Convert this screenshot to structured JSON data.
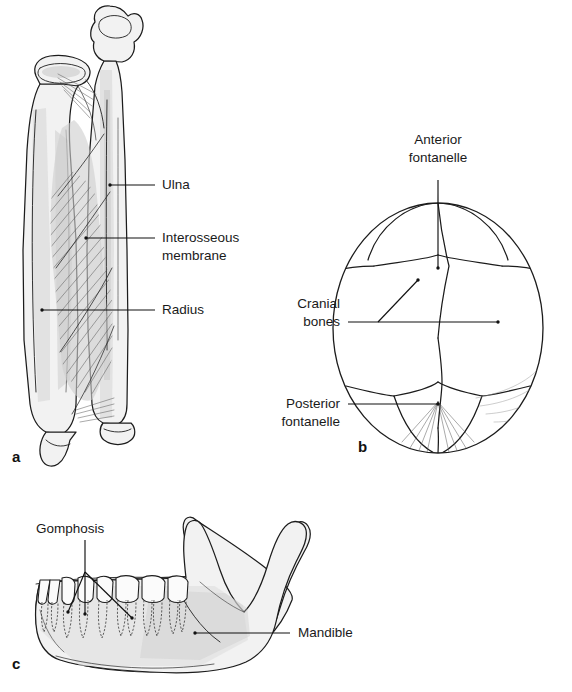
{
  "figure": {
    "background_color": "#ffffff",
    "ink_color": "#1a1a1a",
    "bone_fill_color": "#f2f2f2",
    "fontanelle_fill_color": "#e2e2e2",
    "membrane_fill_color": "#cfcfcf"
  },
  "panels": [
    {
      "id": "a",
      "letter": "a",
      "caption": "Radius and ulna joined by the interosseous membrane",
      "labels": [
        {
          "id": "ulna",
          "text": "Ulna",
          "line2": "",
          "align": "left",
          "x": 162,
          "y": 185
        },
        {
          "id": "interosseous-membrane",
          "text": "Interosseous",
          "line2": "membrane",
          "align": "left",
          "x": 162,
          "y": 238
        },
        {
          "id": "radius",
          "text": "Radius",
          "line2": "",
          "align": "left",
          "x": 162,
          "y": 310
        }
      ]
    },
    {
      "id": "b",
      "letter": "b",
      "caption": "Infant skull showing fontanelles between cranial bones",
      "labels": [
        {
          "id": "anterior-fontanelle",
          "text": "Anterior",
          "line2": "fontanelle",
          "align": "center",
          "x": 460,
          "y": 140
        },
        {
          "id": "cranial-bones",
          "text": "Cranial",
          "line2": "bones",
          "align": "right",
          "x": 340,
          "y": 322
        },
        {
          "id": "posterior-fontanelle",
          "text": "Posterior",
          "line2": "fontanelle",
          "align": "right",
          "x": 340,
          "y": 410
        }
      ]
    },
    {
      "id": "c",
      "letter": "c",
      "caption": "Mandible with teeth anchored by gomphoses",
      "labels": [
        {
          "id": "gomphosis",
          "text": "Gomphosis",
          "line2": "",
          "align": "left",
          "x": 36,
          "y": 529
        },
        {
          "id": "mandible",
          "text": "Mandible",
          "line2": "",
          "align": "left",
          "x": 300,
          "y": 631
        }
      ]
    }
  ]
}
